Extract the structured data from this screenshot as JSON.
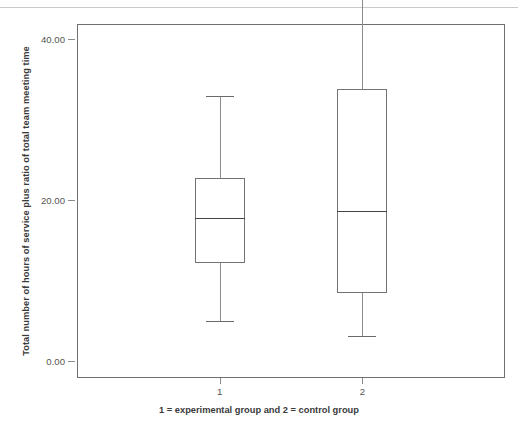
{
  "chart_data": {
    "type": "box",
    "title": "",
    "xlabel": "1 = experimental group and 2 = control group",
    "ylabel": "Total number of hours of service plus ratio of total team meeting time",
    "categories": [
      "1",
      "2"
    ],
    "ylim": [
      -2.0,
      42.0
    ],
    "yticks": [
      0.0,
      20.0,
      40.0
    ],
    "ytick_labels": [
      "0.00",
      "20.00",
      "40.00"
    ],
    "grid": false,
    "legend": null,
    "boxes": [
      {
        "category": "1",
        "group_name": "experimental group",
        "whisker_low": 5.1,
        "q1": 12.3,
        "median": 17.9,
        "q3": 22.8,
        "whisker_high": 33.1,
        "outliers": []
      },
      {
        "category": "2",
        "group_name": "control group",
        "whisker_low": 3.2,
        "q1": 8.6,
        "median": 18.7,
        "q3": 33.9,
        "whisker_high": 46.7,
        "outliers": []
      }
    ],
    "colors": {
      "box_stroke": "#737373",
      "median_stroke": "#444444",
      "whisker_stroke": "#8d8d8d",
      "frame_stroke": "#6f6f6f",
      "background": "#ffffff",
      "text": "#3a3a3a",
      "tick_text": "#555555"
    }
  }
}
